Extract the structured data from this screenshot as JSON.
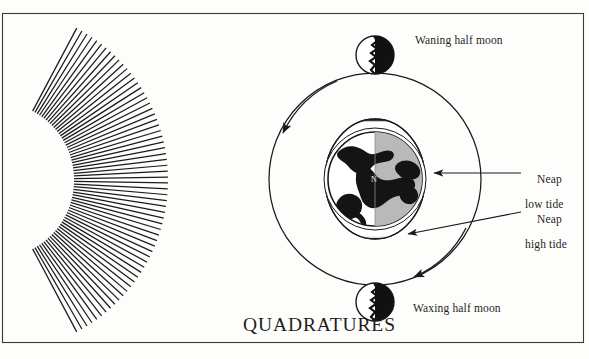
{
  "figure": {
    "title": "QUADRATURES",
    "domain_subject": "tides-quadrature-diagram",
    "frame": {
      "border_color": "#3c3a38"
    },
    "background_color": "#fdfdfc",
    "ink_color": "#1a1a1a"
  },
  "labels": {
    "waning_half_moon": "Waning half moon",
    "waxing_half_moon": "Waxing half moon",
    "neap_low_tide_line1": "Neap",
    "neap_low_tide_line2": "low tide",
    "neap_high_tide_line1": "Neap",
    "neap_high_tide_line2": "high tide",
    "earth_pole_marker": "N"
  },
  "elements": {
    "sun_rays": {
      "name": "sun-rays",
      "ray_count": 64,
      "center_x": -4,
      "center_y": 180,
      "inner_radius": 78,
      "outer_radius": 172,
      "start_angle_deg": -62,
      "end_angle_deg": 62,
      "stroke_color": "#1a1a1a"
    },
    "moon_orbit": {
      "name": "moon-orbit-circle",
      "center_x": 375,
      "center_y": 179,
      "radius": 106,
      "stroke_color": "#1a1a1a"
    },
    "earth": {
      "name": "earth-globe",
      "center_x": 375,
      "center_y": 179,
      "radius": 47,
      "lit_half": "right",
      "lit_color": "#b9b9b9",
      "dark_color": "#ffffff",
      "land_color": "#141414"
    },
    "tidal_bulge": {
      "name": "neap-tide-bulge-ellipse",
      "center_x": 375,
      "center_y": 179,
      "rx": 50,
      "ry": 60,
      "hatch_color": "#1a1a1a",
      "orientation": "vertical"
    },
    "moon_top": {
      "name": "moon-waning-half",
      "center_x": 375,
      "center_y": 55,
      "radius": 19,
      "dark_side": "right"
    },
    "moon_bottom": {
      "name": "moon-waxing-half",
      "center_x": 375,
      "center_y": 302,
      "radius": 19,
      "dark_side": "right"
    },
    "orbit_arrows": [
      {
        "name": "orbit-arrow-upper-left",
        "direction": "counterclockwise"
      },
      {
        "name": "orbit-arrow-lower-right",
        "direction": "counterclockwise"
      }
    ],
    "leader_lines": [
      {
        "name": "leader-neap-low-tide",
        "from_x": 521,
        "from_y": 173,
        "to_x": 432,
        "to_y": 173
      },
      {
        "name": "leader-neap-high-tide",
        "from_x": 521,
        "from_y": 212,
        "to_x": 406,
        "to_y": 235
      }
    ]
  }
}
